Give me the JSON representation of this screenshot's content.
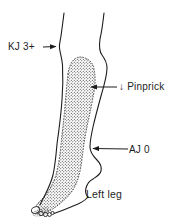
{
  "diagram": {
    "caption": "Left leg",
    "annotations": {
      "knee_jerk": "KJ 3+",
      "pinprick": "↓ Pinprick",
      "ankle_jerk": "AJ 0"
    },
    "regions": {
      "stippled_area_meaning": "pinprick-deficit-region"
    },
    "colors": {
      "line": "#1d1d1d",
      "stipple_dot": "#2b2b2b",
      "background": "#ffffff"
    }
  }
}
